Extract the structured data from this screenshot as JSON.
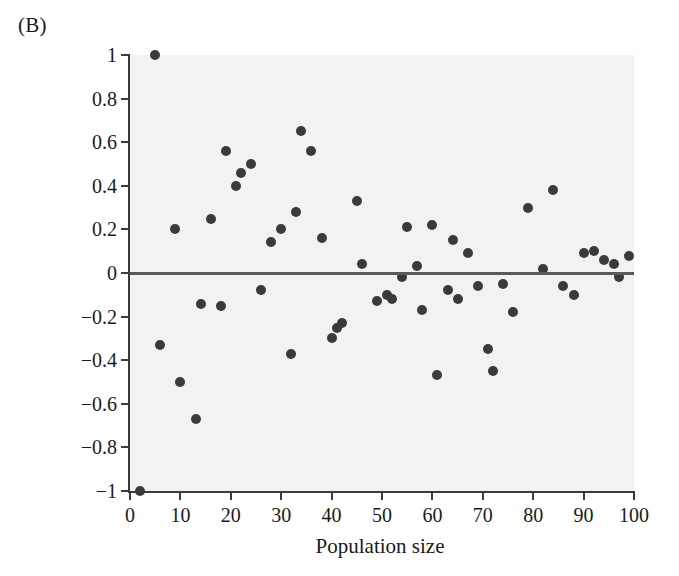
{
  "figure": {
    "panel_label": "(B)"
  },
  "chart_data": {
    "type": "scatter",
    "title": "",
    "xlabel": "Population size",
    "ylabel": "Relative departure",
    "xlim": [
      0,
      100
    ],
    "ylim": [
      -1,
      1
    ],
    "xticks": [
      0,
      10,
      20,
      30,
      40,
      50,
      60,
      70,
      80,
      90,
      100
    ],
    "xtick_labels": [
      "0",
      "10",
      "20",
      "30",
      "40",
      "50",
      "60",
      "70",
      "80",
      "90",
      "100"
    ],
    "yticks": [
      -1,
      -0.8,
      -0.6,
      -0.4,
      -0.2,
      0,
      0.2,
      0.4,
      0.6,
      0.8,
      1
    ],
    "ytick_labels": [
      "−1",
      "−0.8",
      "−0.6",
      "−0.4",
      "−0.2",
      "0",
      "0.2",
      "0.4",
      "0.6",
      "0.8",
      "1"
    ],
    "grid": false,
    "legend": null,
    "plot_background": "#f2f2f1",
    "marker_color": "#3a3a3a",
    "marker_size": 10,
    "reference_line": {
      "orientation": "horizontal",
      "y": 0,
      "color": "#5a5a5a",
      "width": 3
    },
    "x": [
      2,
      5,
      6,
      9,
      10,
      12,
      13,
      15,
      17,
      18,
      20,
      21,
      22,
      24,
      25,
      27,
      28,
      29,
      31,
      32,
      34,
      35,
      37,
      39,
      40,
      41,
      42,
      43,
      45,
      46,
      47,
      49,
      50,
      51,
      53,
      54,
      56,
      57,
      58,
      60,
      61,
      62,
      63,
      64,
      66,
      67,
      69,
      70,
      71,
      72,
      74,
      75,
      77,
      79,
      81,
      82,
      84,
      85,
      86,
      88,
      89,
      91,
      93,
      94,
      96,
      97,
      99
    ],
    "y": [
      -1.0,
      1.0,
      -0.33,
      0.2,
      -0.5,
      -0.67,
      -0.14,
      0.25,
      0.56,
      -0.15,
      0.4,
      0.46,
      0.5,
      0.5,
      -0.08,
      0.14,
      0.17,
      -0.37,
      0.28,
      0.65,
      0.56,
      0.16,
      -0.3,
      -0.25,
      -0.23,
      0.33,
      -0.02,
      0.04,
      -0.13,
      -0.1,
      -0.12,
      0.21,
      0.03,
      -0.17,
      0.03,
      0.22,
      -0.47,
      -0.08,
      -0.12,
      0.15,
      0.09,
      -0.45,
      -0.06,
      -0.35,
      0.3,
      -0.18,
      0.38,
      0.02,
      -0.05,
      -0.1,
      0.09,
      0.1,
      0.06,
      0.04,
      -0.02,
      0.08
    ],
    "points": [
      {
        "x": 2,
        "y": -1.0
      },
      {
        "x": 5,
        "y": 1.0
      },
      {
        "x": 6,
        "y": -0.33
      },
      {
        "x": 9,
        "y": 0.2
      },
      {
        "x": 10,
        "y": -0.5
      },
      {
        "x": 13,
        "y": -0.67
      },
      {
        "x": 14,
        "y": -0.14
      },
      {
        "x": 16,
        "y": 0.25
      },
      {
        "x": 19,
        "y": 0.56
      },
      {
        "x": 18,
        "y": -0.15
      },
      {
        "x": 21,
        "y": 0.4
      },
      {
        "x": 22,
        "y": 0.46
      },
      {
        "x": 24,
        "y": 0.5
      },
      {
        "x": 26,
        "y": -0.08
      },
      {
        "x": 28,
        "y": 0.14
      },
      {
        "x": 30,
        "y": 0.2
      },
      {
        "x": 32,
        "y": -0.37
      },
      {
        "x": 33,
        "y": 0.28
      },
      {
        "x": 34,
        "y": 0.65
      },
      {
        "x": 36,
        "y": 0.56
      },
      {
        "x": 38,
        "y": 0.16
      },
      {
        "x": 40,
        "y": -0.3
      },
      {
        "x": 41,
        "y": -0.25
      },
      {
        "x": 42,
        "y": -0.23
      },
      {
        "x": 45,
        "y": 0.33
      },
      {
        "x": 46,
        "y": 0.04
      },
      {
        "x": 49,
        "y": -0.13
      },
      {
        "x": 51,
        "y": -0.1
      },
      {
        "x": 52,
        "y": -0.12
      },
      {
        "x": 54,
        "y": -0.02
      },
      {
        "x": 55,
        "y": 0.21
      },
      {
        "x": 57,
        "y": 0.03
      },
      {
        "x": 58,
        "y": -0.17
      },
      {
        "x": 60,
        "y": 0.22
      },
      {
        "x": 61,
        "y": -0.47
      },
      {
        "x": 63,
        "y": -0.08
      },
      {
        "x": 64,
        "y": 0.15
      },
      {
        "x": 65,
        "y": -0.12
      },
      {
        "x": 67,
        "y": 0.09
      },
      {
        "x": 69,
        "y": -0.06
      },
      {
        "x": 71,
        "y": -0.35
      },
      {
        "x": 72,
        "y": -0.45
      },
      {
        "x": 74,
        "y": -0.05
      },
      {
        "x": 76,
        "y": -0.18
      },
      {
        "x": 79,
        "y": 0.3
      },
      {
        "x": 82,
        "y": 0.02
      },
      {
        "x": 84,
        "y": 0.38
      },
      {
        "x": 86,
        "y": -0.06
      },
      {
        "x": 88,
        "y": -0.1
      },
      {
        "x": 90,
        "y": 0.09
      },
      {
        "x": 92,
        "y": 0.1
      },
      {
        "x": 94,
        "y": 0.06
      },
      {
        "x": 96,
        "y": 0.04
      },
      {
        "x": 97,
        "y": -0.02
      },
      {
        "x": 99,
        "y": 0.08
      }
    ]
  }
}
